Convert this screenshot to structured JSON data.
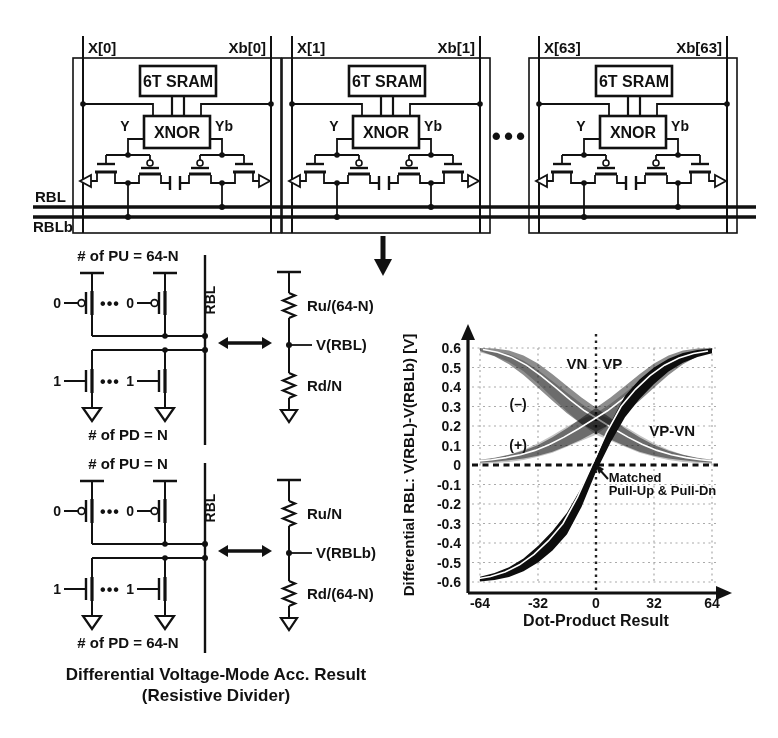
{
  "figure": {
    "array": {
      "cells": [
        {
          "x_label": "X[0]",
          "xb_label": "Xb[0]",
          "sram_label": "6T SRAM",
          "xnor_label": "XNOR",
          "y_label": "Y",
          "yb_label": "Yb"
        },
        {
          "x_label": "X[1]",
          "xb_label": "Xb[1]",
          "sram_label": "6T SRAM",
          "xnor_label": "XNOR",
          "y_label": "Y",
          "yb_label": "Yb"
        },
        {
          "x_label": "X[63]",
          "xb_label": "Xb[63]",
          "sram_label": "6T SRAM",
          "xnor_label": "XNOR",
          "y_label": "Y",
          "yb_label": "Yb"
        }
      ],
      "ellipsis": "•••",
      "rbl_label": "RBL",
      "rblb_label": "RBLb"
    },
    "blocks": [
      {
        "pu_title": "# of PU = 64-N",
        "pd_title": "# of PD = N",
        "bitline_label": "RBL",
        "pu_gate": "0",
        "pd_gate": "1",
        "pu_dots": "•••",
        "pd_dots": "•••"
      },
      {
        "pu_title": "# of PU = N",
        "pd_title": "# of PD = 64-N",
        "bitline_label": "RBL",
        "pu_gate": "0",
        "pd_gate": "1",
        "pu_dots": "•••",
        "pd_dots": "•••"
      }
    ],
    "dividers": [
      {
        "top_resistor": "Ru/(64-N)",
        "node_label": "V(RBL)",
        "bottom_resistor": "Rd/N"
      },
      {
        "top_resistor": "Ru/N",
        "node_label": "V(RBLb)",
        "bottom_resistor": "Rd/(64-N)"
      }
    ],
    "caption_line1": "Differential Voltage-Mode Acc. Result",
    "caption_line2": "(Resistive Divider)"
  },
  "chart_data": {
    "type": "line",
    "title": "",
    "xlabel": "Dot-Product Result",
    "ylabel": "Differential RBL: V(RBL)-V(RBLb) [V]",
    "xlim": [
      -64,
      64
    ],
    "ylim": [
      -0.6,
      0.6
    ],
    "xticks": [
      -64,
      -32,
      0,
      32,
      64
    ],
    "yticks": [
      0.6,
      0.5,
      0.4,
      0.3,
      0.2,
      0.1,
      0,
      -0.1,
      -0.2,
      -0.3,
      -0.4,
      -0.5,
      -0.6
    ],
    "grid": true,
    "legend_position": "none",
    "x": [
      -64,
      -56,
      -48,
      -40,
      -32,
      -24,
      -16,
      -8,
      0,
      8,
      16,
      24,
      32,
      40,
      48,
      56,
      64
    ],
    "series": [
      {
        "name": "VP (+)",
        "color": "#c4c4c4",
        "blend": true,
        "y": [
          0.015,
          0.022,
          0.034,
          0.052,
          0.077,
          0.108,
          0.145,
          0.18,
          0.21,
          0.262,
          0.322,
          0.388,
          0.452,
          0.508,
          0.548,
          0.572,
          0.585
        ],
        "hw": [
          0.008,
          0.012,
          0.018,
          0.026,
          0.035,
          0.045,
          0.052,
          0.055,
          0.055,
          0.052,
          0.048,
          0.042,
          0.035,
          0.027,
          0.02,
          0.013,
          0.008
        ]
      },
      {
        "name": "VN (+)",
        "color": "#c4c4c4",
        "blend": true,
        "y": [
          0.585,
          0.572,
          0.548,
          0.508,
          0.452,
          0.388,
          0.322,
          0.262,
          0.21,
          0.18,
          0.145,
          0.108,
          0.077,
          0.052,
          0.034,
          0.022,
          0.015
        ],
        "hw": [
          0.008,
          0.013,
          0.02,
          0.027,
          0.035,
          0.042,
          0.048,
          0.052,
          0.055,
          0.055,
          0.052,
          0.045,
          0.035,
          0.026,
          0.018,
          0.012,
          0.008
        ]
      },
      {
        "name": "VN (-)",
        "color": "#8d8d8d",
        "blend": true,
        "white_line": true,
        "wl_dx": 3,
        "y": [
          0.592,
          0.578,
          0.552,
          0.512,
          0.458,
          0.398,
          0.335,
          0.278,
          0.232,
          0.186,
          0.143,
          0.105,
          0.075,
          0.053,
          0.038,
          0.027,
          0.02
        ],
        "hw": [
          0.008,
          0.02,
          0.035,
          0.05,
          0.062,
          0.068,
          0.07,
          0.068,
          0.062,
          0.055,
          0.046,
          0.037,
          0.028,
          0.02,
          0.014,
          0.01,
          0.007
        ]
      },
      {
        "name": "VP (-)",
        "color": "#8d8d8d",
        "blend": true,
        "white_line": true,
        "wl_dx": -3,
        "y": [
          0.02,
          0.027,
          0.038,
          0.053,
          0.075,
          0.105,
          0.143,
          0.186,
          0.232,
          0.278,
          0.335,
          0.398,
          0.458,
          0.512,
          0.552,
          0.578,
          0.592
        ],
        "hw": [
          0.007,
          0.01,
          0.014,
          0.02,
          0.028,
          0.037,
          0.046,
          0.055,
          0.062,
          0.068,
          0.07,
          0.068,
          0.062,
          0.05,
          0.035,
          0.02,
          0.008
        ]
      },
      {
        "name": "VP-VN",
        "color": "#0d0d0d",
        "white_line": true,
        "wl_dx": -4,
        "y": [
          -0.585,
          -0.572,
          -0.549,
          -0.512,
          -0.458,
          -0.388,
          -0.3,
          -0.165,
          0,
          0.165,
          0.3,
          0.388,
          0.458,
          0.512,
          0.549,
          0.572,
          0.585
        ],
        "hw": [
          0.012,
          0.018,
          0.025,
          0.033,
          0.042,
          0.05,
          0.055,
          0.05,
          0.035,
          0.05,
          0.055,
          0.05,
          0.042,
          0.033,
          0.025,
          0.018,
          0.012
        ]
      }
    ],
    "annotations": [
      {
        "text": "VN",
        "x": -10.5,
        "y": 0.49,
        "color": "#8f8f8f",
        "size": 15
      },
      {
        "text": "VP",
        "x": 9,
        "y": 0.49,
        "color": "#a8a8a8",
        "size": 15
      },
      {
        "text": "(–)",
        "x": -43,
        "y": 0.285,
        "color": "#9e9e9e",
        "size": 14
      },
      {
        "text": "(+)",
        "x": -43,
        "y": 0.075,
        "color": "#bdbdbd",
        "size": 14
      },
      {
        "text": "VP-VN",
        "x": 42,
        "y": 0.15,
        "color": "#111111",
        "size": 15
      },
      {
        "text": "Matched",
        "x": 7,
        "y": -0.085,
        "color": "#111111",
        "size": 13,
        "anchor": "start"
      },
      {
        "text": "Pull-Up & Pull-Dn",
        "x": 7,
        "y": -0.155,
        "color": "#111111",
        "size": 13,
        "anchor": "start"
      }
    ]
  }
}
